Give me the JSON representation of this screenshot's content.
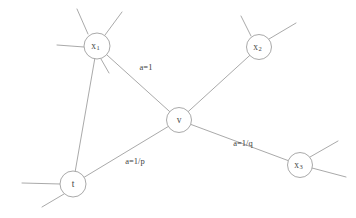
{
  "diagram": {
    "background_color": "#ffffff",
    "line_color": "#9a9a9a",
    "text_color": "#3f3f3f",
    "width": 356,
    "height": 218
  },
  "nodes": [
    {
      "id": "x1",
      "label": "x",
      "subscript": "1",
      "cx": 97,
      "cy": 46,
      "r": 13
    },
    {
      "id": "x2",
      "label": "x",
      "subscript": "2",
      "cx": 259,
      "cy": 47,
      "r": 12.5
    },
    {
      "id": "v",
      "label": "v",
      "subscript": "",
      "cx": 179,
      "cy": 120,
      "r": 12.5
    },
    {
      "id": "x3",
      "label": "x",
      "subscript": "3",
      "cx": 300,
      "cy": 165,
      "r": 12.5
    },
    {
      "id": "t",
      "label": "t",
      "subscript": "",
      "cx": 73,
      "cy": 184,
      "r": 13
    }
  ],
  "edges": [
    {
      "id": "x1-v",
      "from": "x1",
      "to": "v",
      "label": "a=1",
      "label_x": 146,
      "label_y": 68
    },
    {
      "id": "x2-v",
      "from": "x2",
      "to": "v",
      "label": "",
      "label_x": 0,
      "label_y": 0
    },
    {
      "id": "v-t",
      "from": "v",
      "to": "t",
      "label": "a=1/p",
      "label_x": 135,
      "label_y": 162
    },
    {
      "id": "v-x3",
      "from": "v",
      "to": "x3",
      "label": "a=1/q",
      "label_x": 243,
      "label_y": 144
    },
    {
      "id": "x1-t",
      "from": "x1",
      "to": "t",
      "label": "",
      "label_x": 0,
      "label_y": 0
    }
  ],
  "stubs": [
    {
      "id": "x1-stub-up-left",
      "node": "x1",
      "x1": 88,
      "y1": 34,
      "x2": 77,
      "y2": 9
    },
    {
      "id": "x1-stub-up-right",
      "node": "x1",
      "x1": 105,
      "y1": 35,
      "x2": 122,
      "y2": 12
    },
    {
      "id": "x1-stub-left",
      "node": "x1",
      "x1": 84,
      "y1": 47,
      "x2": 57,
      "y2": 45
    },
    {
      "id": "x1-stub-down",
      "node": "x1",
      "x1": 101,
      "y1": 59,
      "x2": 109,
      "y2": 73
    },
    {
      "id": "x2-stub-up-left",
      "node": "x2",
      "x2": 241,
      "y2": 16,
      "x1": 251,
      "y1": 36
    },
    {
      "id": "x2-stub-up-right",
      "node": "x2",
      "x1": 269,
      "y1": 39,
      "x2": 296,
      "y2": 23
    },
    {
      "id": "x3-stub-up-right",
      "node": "x3",
      "x1": 310,
      "y1": 157,
      "x2": 338,
      "y2": 141
    },
    {
      "id": "x3-stub-down-right",
      "node": "x3",
      "x1": 312,
      "y1": 168,
      "x2": 346,
      "y2": 177
    },
    {
      "id": "t-stub-left",
      "node": "t",
      "x1": 60,
      "y1": 184,
      "x2": 22,
      "y2": 183
    },
    {
      "id": "t-stub-down-left",
      "node": "t",
      "x1": 64,
      "y1": 194,
      "x2": 42,
      "y2": 207
    }
  ]
}
